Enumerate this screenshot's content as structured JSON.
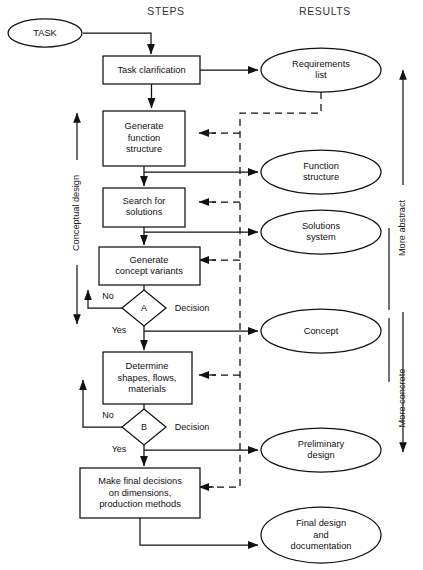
{
  "diagram": {
    "columns": {
      "steps": "STEPS",
      "results": "RESULTS"
    },
    "start": {
      "label": "TASK"
    },
    "steps": [
      {
        "id": "task-clarification",
        "label": "Task clarification"
      },
      {
        "id": "generate-function-structure",
        "label": "Generate\nfunction\nstructure"
      },
      {
        "id": "search-for-solutions",
        "label": "Search for\nsolutions"
      },
      {
        "id": "generate-concept-variants",
        "label": "Generate\nconcept variants"
      },
      {
        "id": "determine-shapes",
        "label": "Determine\nshapes, flows,\nmaterials"
      },
      {
        "id": "make-final-decisions",
        "label": "Make final decisions\non dimensions,\nproduction methods"
      }
    ],
    "results": [
      {
        "id": "requirements-list",
        "label": "Requirements\nlist"
      },
      {
        "id": "function-structure",
        "label": "Function\nstructure"
      },
      {
        "id": "solutions-system",
        "label": "Solutions\nsystem"
      },
      {
        "id": "concept",
        "label": "Concept"
      },
      {
        "id": "preliminary-design",
        "label": "Preliminary\ndesign"
      },
      {
        "id": "final-design",
        "label": "Final design\nand\ndocumentation"
      }
    ],
    "decisions": [
      {
        "id": "decision-a",
        "marker": "A",
        "label": "Decision",
        "no": "No",
        "yes": "Yes"
      },
      {
        "id": "decision-b",
        "marker": "B",
        "label": "Decision",
        "no": "No",
        "yes": "Yes"
      }
    ],
    "annotations": {
      "phase": "Conceptual design",
      "abstract": "More abstract",
      "concrete": "More concrete"
    },
    "colors": {
      "stroke": "#111111",
      "fill": "#ffffff",
      "text": "#111111",
      "background": "#ffffff"
    }
  }
}
